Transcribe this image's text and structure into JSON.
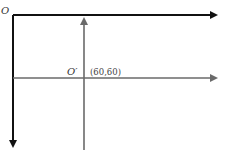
{
  "diagram": {
    "origin_label": "O",
    "new_origin_label": "O′",
    "new_origin_coords": "(60,60)",
    "colors": {
      "primary_axes": "#111111",
      "secondary_axes": "#6a6a6a",
      "background": "#ffffff"
    }
  }
}
